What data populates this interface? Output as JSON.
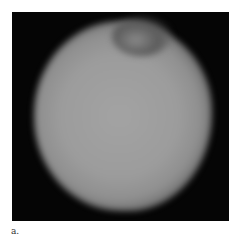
{
  "figure": {
    "panel_label": "a.",
    "image_description": "grayscale blob on black background",
    "colors": {
      "background": "#050505",
      "blob_center": "#9c9c9c",
      "page": "#ffffff"
    }
  }
}
